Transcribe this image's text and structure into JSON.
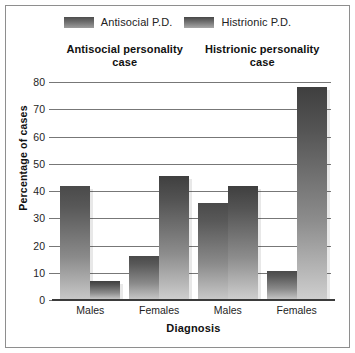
{
  "chart_data": {
    "type": "bar",
    "title": "",
    "xlabel": "Diagnosis",
    "ylabel": "Percentage of cases",
    "ylim": [
      0,
      80
    ],
    "yticks": [
      0,
      10,
      20,
      30,
      40,
      50,
      60,
      70,
      80
    ],
    "grid": true,
    "legend_position": "top",
    "group_titles": [
      "Antisocial personality case",
      "Histrionic personality case"
    ],
    "categories": [
      "Males",
      "Females",
      "Males",
      "Females"
    ],
    "series": [
      {
        "name": "Antisocial P.D.",
        "color": "#5a5a5a",
        "values": [
          42,
          16,
          35.5,
          10.5
        ]
      },
      {
        "name": "Histrionic P.D.",
        "color": "#5a5a5a",
        "values": [
          7,
          45.5,
          42,
          78
        ]
      }
    ],
    "groups": [
      {
        "title": "Antisocial personality case",
        "bars": [
          {
            "category": "Males",
            "series": "Antisocial P.D.",
            "value": 42
          },
          {
            "category": "Males",
            "series": "Histrionic P.D.",
            "value": 7
          },
          {
            "category": "Females",
            "series": "Antisocial P.D.",
            "value": 16
          },
          {
            "category": "Females",
            "series": "Histrionic P.D.",
            "value": 45.5
          }
        ]
      },
      {
        "title": "Histrionic personality case",
        "bars": [
          {
            "category": "Males",
            "series": "Antisocial P.D.",
            "value": 35.5
          },
          {
            "category": "Males",
            "series": "Histrionic P.D.",
            "value": 42
          },
          {
            "category": "Females",
            "series": "Antisocial P.D.",
            "value": 10.5
          },
          {
            "category": "Females",
            "series": "Histrionic P.D.",
            "value": 78
          }
        ]
      }
    ]
  },
  "legend": {
    "entries": [
      {
        "label": "Antisocial P.D."
      },
      {
        "label": "Histrionic P.D."
      }
    ]
  },
  "axes": {
    "y": {
      "title": "Percentage of cases",
      "ticks": [
        "80",
        "70",
        "60",
        "50",
        "40",
        "30",
        "20",
        "10",
        "0"
      ]
    },
    "x": {
      "title": "Diagnosis",
      "ticks": [
        "Males",
        "Females",
        "Males",
        "Females"
      ]
    }
  },
  "group_titles": {
    "left": "Antisocial personality\ncase",
    "right": "Histrionic personality\ncase",
    "left_line1": "Antisocial personality",
    "left_line2": "case",
    "right_line1": "Histrionic personality",
    "right_line2": "case"
  }
}
